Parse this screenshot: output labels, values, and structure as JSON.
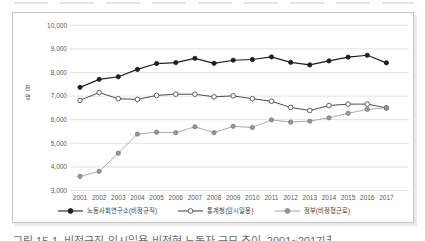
{
  "chart_data": {
    "type": "line",
    "title": "",
    "xlabel": "",
    "ylabel": "천명",
    "ylim": [
      3000,
      10000
    ],
    "ytick_interval": 1000,
    "yticks": [
      "10,000",
      "9,000",
      "8,000",
      "7,000",
      "6,000",
      "5,000",
      "4,000",
      "3,000"
    ],
    "grid": true,
    "legend_position": "bottom",
    "categories": [
      "2001",
      "2002",
      "2003",
      "2004",
      "2005",
      "2006",
      "2007",
      "2008",
      "2009",
      "2010",
      "2011",
      "2012",
      "2013",
      "2014",
      "2015",
      "2016",
      "2017"
    ],
    "series": [
      {
        "name": "노동사회연구소(비정규직)",
        "color": "#1f1f1f",
        "marker": "filled",
        "marker_fill": "#1f1f1f",
        "marker_stroke": "#1f1f1f",
        "values": [
          7370,
          7710,
          7820,
          8130,
          8380,
          8420,
          8600,
          8390,
          8520,
          8550,
          8660,
          8430,
          8320,
          8490,
          8650,
          8730,
          8410
        ]
      },
      {
        "name": "통계청(임시일용)",
        "color": "#4d4d4d",
        "marker": "open",
        "marker_fill": "#ffffff",
        "marker_stroke": "#4d4d4d",
        "values": [
          6820,
          7150,
          6890,
          6860,
          7030,
          7080,
          7080,
          6970,
          7010,
          6890,
          6780,
          6520,
          6390,
          6600,
          6660,
          6660,
          6500
        ]
      },
      {
        "name": "정부(비정형근로)",
        "color": "#ababab",
        "marker": "filled",
        "marker_fill": "#999999",
        "marker_stroke": "#7d7d7d",
        "values": [
          3600,
          3810,
          4580,
          5390,
          5470,
          5450,
          5700,
          5450,
          5720,
          5670,
          5990,
          5900,
          5940,
          6080,
          6270,
          6440,
          6500
        ]
      }
    ]
  },
  "colors": {
    "gridline": "#e3e3e3",
    "tick_text": "#595959",
    "box_border": "#c6c6c6"
  },
  "caption": "그림 15-1. 비정규직·임시일용·비정형 노동자 규모 추이, 2001~2017년"
}
